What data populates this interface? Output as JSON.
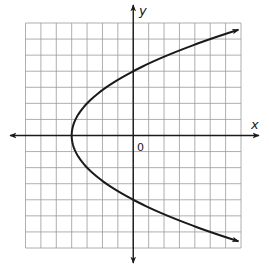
{
  "chart_data": {
    "type": "line",
    "title": "",
    "xlabel": "x",
    "ylabel": "y",
    "origin_label": "0",
    "xlim": [
      -7,
      7
    ],
    "ylim": [
      -7,
      7
    ],
    "grid": true,
    "grid_step": 1,
    "legend": null,
    "series": [
      {
        "name": "parabola",
        "equation": "x = y^2/4 - 4",
        "vertex": [
          -4,
          0
        ],
        "y_intercepts": [
          [
            0,
            4
          ],
          [
            0,
            -4
          ]
        ],
        "opens": "right",
        "arrows_at_ends": true,
        "points": [
          [
            7,
            6.63
          ],
          [
            5,
            6
          ],
          [
            2.25,
            5
          ],
          [
            0,
            4
          ],
          [
            -1.75,
            3
          ],
          [
            -3,
            2
          ],
          [
            -3.75,
            1
          ],
          [
            -4,
            0
          ],
          [
            -3.75,
            -1
          ],
          [
            -3,
            -2
          ],
          [
            -1.75,
            -3
          ],
          [
            0,
            -4
          ],
          [
            2.25,
            -5
          ],
          [
            5,
            -6
          ],
          [
            7,
            -6.63
          ]
        ]
      }
    ]
  },
  "colors": {
    "grid": "#9a9a9a",
    "axis": "#1a1a1a",
    "curve": "#1a1a1a",
    "background": "#ffffff"
  }
}
